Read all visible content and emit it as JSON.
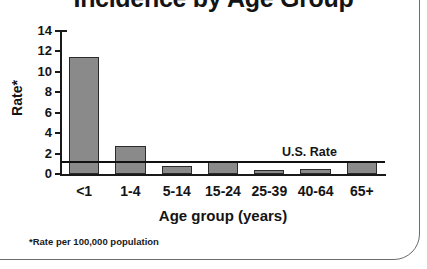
{
  "chart_data": {
    "type": "bar",
    "title": "Incidence by Age Group",
    "categories": [
      "<1",
      "1-4",
      "5-14",
      "15-24",
      "25-39",
      "40-64",
      "65+"
    ],
    "values": [
      11.5,
      2.7,
      0.8,
      1.3,
      0.4,
      0.5,
      1.2
    ],
    "xlabel": "Age group (years)",
    "ylabel": "Rate*",
    "ylim": [
      0,
      14
    ],
    "yticks": [
      0,
      2,
      4,
      6,
      8,
      10,
      12,
      14
    ],
    "ytick_labels": [
      "0",
      "2",
      "4",
      "6",
      "8",
      "10",
      "12",
      "14"
    ],
    "grid": false,
    "legend": "none",
    "annotations": [
      {
        "name": "us-rate-reference-line",
        "label": "U.S. Rate",
        "value": 1.2,
        "orientation": "horizontal"
      }
    ],
    "footnote": "*Rate per 100,000 population",
    "bar_color": "#8a8a8a",
    "bar_edge_color": "#2b2b2b",
    "axis_color": "#1a1a1a",
    "text_color": "#141414",
    "background": "#ffffff"
  }
}
